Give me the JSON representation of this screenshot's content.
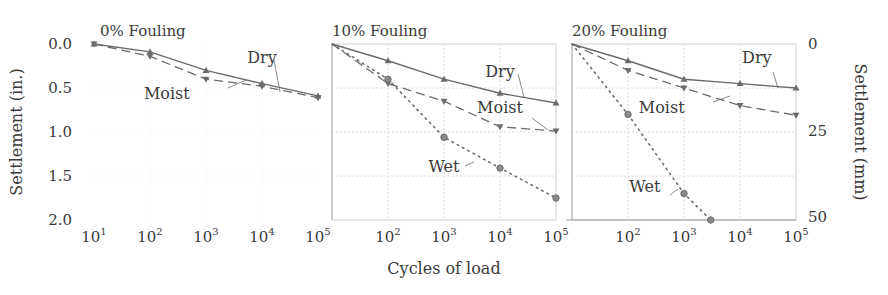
{
  "chart_data": {
    "type": "line",
    "title": "",
    "xlabel": "Cycles of load",
    "ylabel_left": "Settlement (in.)",
    "ylabel_right": "Settlement (mm)",
    "xscale": "log",
    "xlim": [
      10,
      100000
    ],
    "ylim_in": [
      0.0,
      2.0
    ],
    "y_inverted": true,
    "x_tick_labels": [
      "10^1",
      "10^2",
      "10^3",
      "10^4",
      "10^5"
    ],
    "y_tick_labels_left": [
      "0.0",
      "0.5",
      "1.0",
      "1.5",
      "2.0"
    ],
    "y_tick_labels_right": [
      "0",
      "25",
      "50"
    ],
    "grid": true,
    "panels": [
      {
        "title": "0% Fouling",
        "series": [
          {
            "name": "Dry",
            "style": "solid",
            "marker": "triangle-up",
            "x": [
              10,
              100,
              1000,
              10000,
              100000
            ],
            "y": [
              0.0,
              0.09,
              0.3,
              0.45,
              0.59
            ]
          },
          {
            "name": "Moist",
            "style": "dashed",
            "marker": "triangle-down",
            "x": [
              10,
              100,
              1000,
              10000,
              100000
            ],
            "y": [
              0.0,
              0.14,
              0.4,
              0.48,
              0.61
            ]
          }
        ],
        "annotations": [
          {
            "text": "Dry",
            "x": 10000,
            "y": 0.22
          },
          {
            "text": "Moist",
            "x": 200,
            "y": 0.62
          }
        ]
      },
      {
        "title": "10% Fouling",
        "series": [
          {
            "name": "Dry",
            "style": "solid",
            "marker": "triangle-up",
            "x": [
              10,
              100,
              1000,
              10000,
              100000
            ],
            "y": [
              0.0,
              0.19,
              0.4,
              0.56,
              0.67
            ]
          },
          {
            "name": "Moist",
            "style": "dashed",
            "marker": "triangle-down",
            "x": [
              10,
              100,
              1000,
              10000,
              100000
            ],
            "y": [
              0.0,
              0.45,
              0.65,
              0.94,
              0.99
            ]
          },
          {
            "name": "Wet",
            "style": "dotted",
            "marker": "circle",
            "x": [
              10,
              100,
              1000,
              10000,
              100000
            ],
            "y": [
              0.0,
              0.4,
              1.06,
              1.41,
              1.75
            ]
          }
        ],
        "annotations": [
          {
            "text": "Dry",
            "x": 10000,
            "y": 0.38
          },
          {
            "text": "Moist",
            "x": 10000,
            "y": 0.78
          },
          {
            "text": "Wet",
            "x": 1000,
            "y": 1.45
          }
        ]
      },
      {
        "title": "20% Fouling",
        "series": [
          {
            "name": "Dry",
            "style": "solid",
            "marker": "triangle-up",
            "x": [
              10,
              100,
              1000,
              10000,
              100000
            ],
            "y": [
              0.0,
              0.19,
              0.4,
              0.45,
              0.5
            ]
          },
          {
            "name": "Moist",
            "style": "dashed",
            "marker": "triangle-down",
            "x": [
              10,
              100,
              1000,
              10000,
              100000
            ],
            "y": [
              0.0,
              0.3,
              0.5,
              0.7,
              0.81
            ]
          },
          {
            "name": "Wet",
            "style": "dotted",
            "marker": "circle",
            "x": [
              10,
              100,
              1000,
              3000
            ],
            "y": [
              0.0,
              0.8,
              1.7,
              2.0
            ]
          }
        ],
        "annotations": [
          {
            "text": "Dry",
            "x": 20000,
            "y": 0.22
          },
          {
            "text": "Moist",
            "x": 400,
            "y": 0.78
          },
          {
            "text": "Wet",
            "x": 200,
            "y": 1.68
          }
        ]
      }
    ]
  },
  "layout": {
    "panel_x": [
      94,
      332,
      572
    ],
    "decade_px": 56,
    "y_top": 44,
    "px_per_in": 88,
    "line_color": "#6b6b6b",
    "grid_color": "#dcdcdc",
    "text_color": "#3a3a3a"
  }
}
